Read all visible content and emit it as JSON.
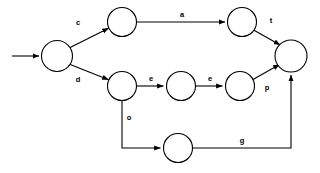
{
  "diagram": {
    "type": "directed-graph",
    "title": "",
    "background_color": "#ffffff",
    "stroke_color": "#000000",
    "node_fill_color": "#ffffff",
    "nodes": [
      {
        "id": "n1",
        "label": "",
        "cx": 57,
        "cy": 56,
        "r": 15.5,
        "name": "node-start"
      },
      {
        "id": "n2",
        "label": "",
        "cx": 122,
        "cy": 22,
        "r": 14.5,
        "name": "node-top-left"
      },
      {
        "id": "n3",
        "label": "",
        "cx": 242,
        "cy": 22,
        "r": 14.5,
        "name": "node-top-right"
      },
      {
        "id": "n4",
        "label": "",
        "cx": 122,
        "cy": 86,
        "r": 14.5,
        "name": "node-middle-1"
      },
      {
        "id": "n5",
        "label": "",
        "cx": 181,
        "cy": 86,
        "r": 14.5,
        "name": "node-middle-2"
      },
      {
        "id": "n6",
        "label": "",
        "cx": 240,
        "cy": 86,
        "r": 14.5,
        "name": "node-middle-3"
      },
      {
        "id": "n7",
        "label": "",
        "cx": 178,
        "cy": 148,
        "r": 14.5,
        "name": "node-bottom"
      },
      {
        "id": "n8",
        "label": "",
        "cx": 291,
        "cy": 56,
        "r": 16.0,
        "name": "node-final"
      }
    ],
    "edges": [
      {
        "id": "e0",
        "from": "",
        "to": "n1",
        "label": "",
        "name": "edge-entry-arrow",
        "label_x": 0,
        "label_y": 0
      },
      {
        "id": "e1",
        "from": "n1",
        "to": "n2",
        "label": "c",
        "name": "edge-c-start-to-top",
        "label_x": 78,
        "label_y": 23
      },
      {
        "id": "e2",
        "from": "n1",
        "to": "n4",
        "label": "d",
        "name": "edge-d-start-to-mid",
        "label_x": 78,
        "label_y": 80
      },
      {
        "id": "e3",
        "from": "n2",
        "to": "n3",
        "label": "a",
        "name": "edge-a-top-row",
        "label_x": 182,
        "label_y": 15
      },
      {
        "id": "e4",
        "from": "n3",
        "to": "n8",
        "label": "t",
        "name": "edge-t-to-final",
        "label_x": 271,
        "label_y": 21
      },
      {
        "id": "e5",
        "from": "n4",
        "to": "n5",
        "label": "e",
        "name": "edge-e-mid-1",
        "label_x": 151,
        "label_y": 79
      },
      {
        "id": "e6",
        "from": "n5",
        "to": "n6",
        "label": "e",
        "name": "edge-e-mid-2",
        "label_x": 210,
        "label_y": 79
      },
      {
        "id": "e7",
        "from": "n6",
        "to": "n8",
        "label": "p",
        "name": "edge-p-to-final",
        "label_x": 267,
        "label_y": 88
      },
      {
        "id": "e8",
        "from": "n4",
        "to": "n7",
        "label": "o",
        "name": "edge-o-mid-to-bottom",
        "label_x": 129,
        "label_y": 118
      },
      {
        "id": "e9",
        "from": "n7",
        "to": "n8",
        "label": "g",
        "name": "edge-g-bottom-to-final",
        "label_x": 242,
        "label_y": 141
      }
    ]
  }
}
